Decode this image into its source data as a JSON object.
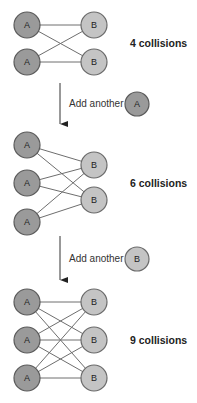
{
  "diagram": {
    "node_labels": {
      "a": "A",
      "b": "B"
    },
    "colors": {
      "node_a_fill": "#9a9a9a",
      "node_b_fill": "#c4c4c4",
      "edge": "#6e6e6e",
      "text": "#222222"
    },
    "stages": [
      {
        "a_count": 2,
        "b_count": 2,
        "collisions_label": "4 collisions"
      },
      {
        "a_count": 3,
        "b_count": 2,
        "collisions_label": "6 collisions"
      },
      {
        "a_count": 3,
        "b_count": 3,
        "collisions_label": "9 collisions"
      }
    ],
    "transitions": [
      {
        "label": "Add another",
        "node": "A"
      },
      {
        "label": "Add another",
        "node": "B"
      }
    ]
  }
}
